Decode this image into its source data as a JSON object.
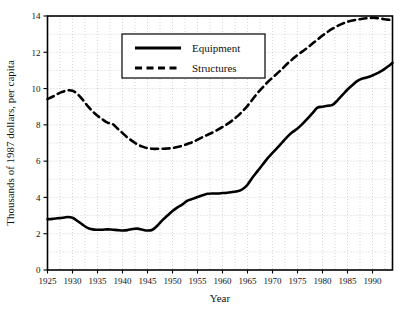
{
  "chart_data": {
    "type": "line",
    "title": "",
    "xlabel": "Year",
    "ylabel": "Thousands of 1987 dollars, per capita",
    "xlim": [
      1925,
      1994
    ],
    "ylim": [
      0,
      14
    ],
    "grid": true,
    "legend_position": "top-center-left",
    "x_ticks": [
      1925,
      1930,
      1935,
      1940,
      1945,
      1950,
      1955,
      1960,
      1965,
      1970,
      1975,
      1980,
      1985,
      1990
    ],
    "x_tick_labels": [
      "1925",
      "1930",
      "1935",
      "1940",
      "1945",
      "1950",
      "1955",
      "1960",
      "1965",
      "1970",
      "1975",
      "1980",
      "1985",
      "1990"
    ],
    "y_ticks": [
      0,
      2,
      4,
      6,
      8,
      10,
      12,
      14
    ],
    "y_tick_labels": [
      "0",
      "2",
      "4",
      "6",
      "8",
      "10",
      "12",
      "14"
    ],
    "y_minor_step": 1,
    "x_minor_step": 2.5,
    "x": [
      1925,
      1926,
      1927,
      1928,
      1929,
      1930,
      1931,
      1932,
      1933,
      1934,
      1935,
      1936,
      1937,
      1938,
      1939,
      1940,
      1941,
      1942,
      1943,
      1944,
      1945,
      1946,
      1947,
      1948,
      1949,
      1950,
      1951,
      1952,
      1953,
      1954,
      1955,
      1956,
      1957,
      1958,
      1959,
      1960,
      1961,
      1962,
      1963,
      1964,
      1965,
      1966,
      1967,
      1968,
      1969,
      1970,
      1971,
      1972,
      1973,
      1974,
      1975,
      1976,
      1977,
      1978,
      1979,
      1980,
      1981,
      1982,
      1983,
      1984,
      1985,
      1986,
      1987,
      1988,
      1989,
      1990,
      1991,
      1992,
      1993,
      1994
    ],
    "series": [
      {
        "name": "Equipment",
        "style": "solid",
        "color": "#000000",
        "values": [
          2.8,
          2.82,
          2.85,
          2.88,
          2.92,
          2.88,
          2.7,
          2.5,
          2.32,
          2.24,
          2.22,
          2.22,
          2.24,
          2.22,
          2.2,
          2.18,
          2.2,
          2.26,
          2.28,
          2.22,
          2.18,
          2.22,
          2.45,
          2.75,
          3.0,
          3.25,
          3.45,
          3.62,
          3.82,
          3.92,
          4.02,
          4.12,
          4.2,
          4.22,
          4.22,
          4.24,
          4.26,
          4.3,
          4.34,
          4.45,
          4.7,
          5.1,
          5.45,
          5.8,
          6.15,
          6.45,
          6.75,
          7.05,
          7.35,
          7.6,
          7.8,
          8.05,
          8.35,
          8.65,
          8.95,
          9.0,
          9.05,
          9.1,
          9.35,
          9.65,
          9.95,
          10.2,
          10.42,
          10.55,
          10.62,
          10.72,
          10.85,
          11.0,
          11.2,
          11.42
        ]
      },
      {
        "name": "Structures",
        "style": "dashed",
        "color": "#000000",
        "values": [
          9.42,
          9.55,
          9.7,
          9.82,
          9.9,
          9.88,
          9.7,
          9.4,
          9.05,
          8.75,
          8.5,
          8.3,
          8.12,
          8.05,
          7.8,
          7.55,
          7.3,
          7.1,
          6.92,
          6.8,
          6.72,
          6.68,
          6.68,
          6.68,
          6.7,
          6.72,
          6.78,
          6.85,
          6.95,
          7.05,
          7.18,
          7.32,
          7.45,
          7.58,
          7.72,
          7.88,
          8.05,
          8.25,
          8.48,
          8.75,
          9.05,
          9.4,
          9.75,
          10.05,
          10.35,
          10.6,
          10.85,
          11.1,
          11.38,
          11.62,
          11.85,
          12.05,
          12.25,
          12.48,
          12.7,
          12.92,
          13.12,
          13.3,
          13.45,
          13.58,
          13.68,
          13.75,
          13.8,
          13.85,
          13.88,
          13.9,
          13.88,
          13.84,
          13.8,
          13.78
        ]
      }
    ],
    "legend": [
      {
        "label": "Equipment",
        "style": "solid"
      },
      {
        "label": "Structures",
        "style": "dashed"
      }
    ]
  }
}
